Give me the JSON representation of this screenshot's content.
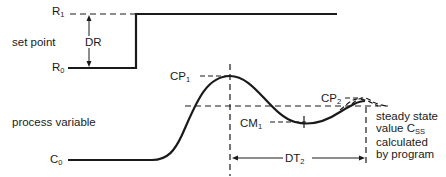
{
  "diagram": {
    "labels": {
      "set_point": "set point",
      "process_variable": "process variable",
      "r1": {
        "base": "R",
        "sub": "1"
      },
      "r0": {
        "base": "R",
        "sub": "0"
      },
      "dr": "DR",
      "c0": {
        "base": "C",
        "sub": "0"
      },
      "cp1": {
        "base": "CP",
        "sub": "1"
      },
      "cp2": {
        "base": "CP",
        "sub": "2"
      },
      "cm1": {
        "base": "CM",
        "sub": "1"
      },
      "dt2": {
        "base": "DT",
        "sub": "2"
      },
      "steady_state_note": {
        "line1": "steady state",
        "line2_base": "value C",
        "line2_sub": "SS",
        "line3": "calculated",
        "line4": "by program"
      }
    },
    "colors": {
      "line": "#1a1a1a",
      "background": "#ffffff"
    }
  }
}
